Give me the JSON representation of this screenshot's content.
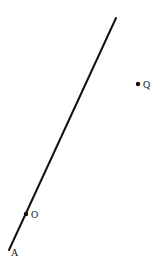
{
  "diagram": {
    "ray": {
      "start": [
        9,
        250
      ],
      "end": [
        116,
        18
      ],
      "color": "#111111"
    },
    "points": [
      {
        "id": "A",
        "label": "A",
        "x": 9,
        "y": 250,
        "dot": false,
        "label_x": 11,
        "label_y": 256
      },
      {
        "id": "O",
        "label": "O",
        "x": 26,
        "y": 214,
        "dot": true,
        "label_x": 31,
        "label_y": 218
      },
      {
        "id": "Q",
        "label": "Q",
        "x": 138,
        "y": 84,
        "dot": true,
        "label_x": 143,
        "label_y": 88
      }
    ]
  }
}
